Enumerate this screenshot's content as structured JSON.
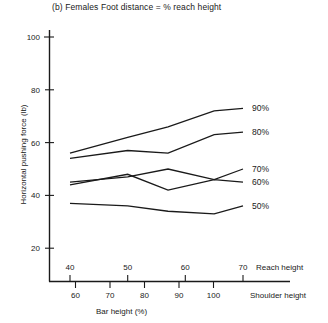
{
  "figure": {
    "title": "(b) Females Foot distance = % reach height",
    "ylabel": "Horizontal pushing force (lb)",
    "xlabel": "Bar height (%)",
    "axis_name_reach": "Reach height",
    "axis_name_shoulder": "Shoulder height"
  },
  "chart_data": {
    "type": "line",
    "title": "(b) Females Foot distance = % reach height",
    "xlabel": "Bar height (%)",
    "ylabel": "Horizontal pushing force (lb)",
    "ylim": [
      0,
      105
    ],
    "yticks": [
      20,
      40,
      60,
      80,
      100
    ],
    "ytick_labels": [
      "20",
      "40",
      "60",
      "80",
      "100"
    ],
    "grid": false,
    "legend_position": "right-of-lines",
    "x_axes": [
      {
        "name": "Reach height",
        "position": "above-axis",
        "ticks": [
          40,
          50,
          60,
          70
        ],
        "tick_labels": [
          "40",
          "50",
          "60",
          "70"
        ]
      },
      {
        "name": "Shoulder height",
        "position": "below-axis",
        "ticks": [
          60,
          70,
          80,
          90,
          100
        ],
        "tick_labels": [
          "60",
          "70",
          "80",
          "90",
          "100"
        ]
      }
    ],
    "x_reach": [
      40,
      50,
      57,
      65,
      70
    ],
    "series": [
      {
        "name": "90%",
        "label": "90%",
        "values": [
          56,
          62,
          66,
          72,
          73
        ]
      },
      {
        "name": "80%",
        "label": "80%",
        "values": [
          54,
          57,
          56,
          63,
          64
        ]
      },
      {
        "name": "70%",
        "label": "70%",
        "values": [
          45,
          47,
          50,
          46,
          50
        ]
      },
      {
        "name": "60%",
        "label": "60%",
        "values": [
          44,
          48,
          42,
          46,
          45
        ]
      },
      {
        "name": "50%",
        "label": "50%",
        "values": [
          37,
          36,
          34,
          33,
          36
        ]
      }
    ]
  }
}
